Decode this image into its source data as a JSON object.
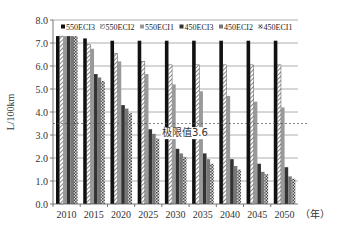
{
  "chart_data": {
    "type": "bar",
    "title": "",
    "xlabel": "（年）",
    "ylabel": "L/100km",
    "ylim": [
      0,
      8
    ],
    "yticks": [
      "0.0",
      "1.0",
      "2.0",
      "3.0",
      "4.0",
      "5.0",
      "6.0",
      "7.0",
      "8.0"
    ],
    "grid": true,
    "legend_position": "top",
    "categories": [
      "2010",
      "2015",
      "2020",
      "2025",
      "2030",
      "2035",
      "2040",
      "2045",
      "2050"
    ],
    "series": [
      {
        "name": "550ECI3",
        "pattern": "solid-black",
        "values": [
          7.3,
          7.2,
          7.1,
          7.1,
          7.1,
          7.1,
          7.1,
          7.1,
          7.1
        ]
      },
      {
        "name": "550ECI2",
        "pattern": "hatched-light",
        "values": [
          7.3,
          6.95,
          6.55,
          6.2,
          6.05,
          6.05,
          6.05,
          6.05,
          6.05
        ]
      },
      {
        "name": "550ECI1",
        "pattern": "gray",
        "values": [
          7.3,
          6.75,
          6.2,
          5.65,
          5.2,
          4.9,
          4.7,
          4.45,
          4.2
        ]
      },
      {
        "name": "450ECI3",
        "pattern": "dark-gray",
        "values": [
          7.3,
          5.65,
          4.3,
          3.25,
          2.4,
          2.2,
          1.95,
          1.75,
          1.6
        ]
      },
      {
        "name": "450ECI2",
        "pattern": "mid-gray",
        "values": [
          7.3,
          5.5,
          4.15,
          3.05,
          2.2,
          1.95,
          1.65,
          1.4,
          1.2
        ]
      },
      {
        "name": "450ECI1",
        "pattern": "checkered",
        "values": [
          7.3,
          5.35,
          3.95,
          2.85,
          2.05,
          1.75,
          1.5,
          1.3,
          1.1
        ]
      }
    ],
    "annotations": [
      {
        "type": "hline",
        "y": 3.5,
        "style": "dashed",
        "label": "极限值3.6"
      }
    ]
  }
}
